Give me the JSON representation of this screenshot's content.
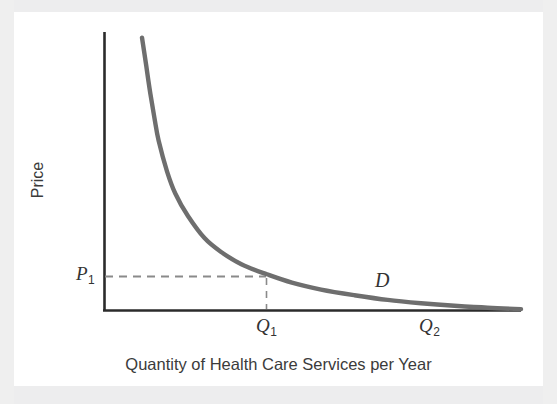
{
  "figure": {
    "background_color": "#f2f2f2",
    "plate_color": "#ffffff",
    "axis_color": "#2b2b2b",
    "curve_color": "#6e6e6e",
    "guide_color": "#8a8a8a",
    "text_color": "#3b3b3b"
  },
  "axes": {
    "y_title": "Price",
    "x_title": "Quantity of Health Care Services per Year"
  },
  "annotations": {
    "price_point": {
      "symbol": "P",
      "subscript": "1"
    },
    "quantity_1": {
      "symbol": "Q",
      "subscript": "1"
    },
    "quantity_2": {
      "symbol": "Q",
      "subscript": "2"
    },
    "demand_curve": {
      "symbol": "D"
    }
  },
  "chart_data": {
    "type": "line",
    "title": "",
    "xlabel": "Quantity of Health Care Services per Year",
    "ylabel": "Price",
    "grid": false,
    "legend_position": "inline",
    "xlim": [
      0,
      100
    ],
    "ylim": [
      0,
      100
    ],
    "axis_tick_labels": {
      "x": [
        "Q1",
        "Q2"
      ],
      "y": [
        "P1"
      ]
    },
    "series": [
      {
        "name": "D",
        "label": "D",
        "description": "Downward-sloping convex demand curve for health care services, asymptotic to both axes",
        "x": [
          9,
          10,
          11,
          12,
          13,
          15,
          17,
          20,
          24,
          28,
          33,
          39,
          45,
          52,
          60,
          68,
          76,
          84,
          92,
          100
        ],
        "y": [
          98,
          88,
          78,
          69,
          61,
          50,
          42,
          34,
          26,
          21,
          16.5,
          13,
          10,
          7.5,
          5.5,
          3.8,
          2.6,
          1.7,
          1.0,
          0.5
        ]
      }
    ],
    "reference_lines": [
      {
        "name": "price-guide",
        "orientation": "horizontal",
        "style": "dashed",
        "from": [
          0,
          23
        ],
        "to": [
          39,
          23
        ],
        "label": "P1"
      },
      {
        "name": "quantity-guide",
        "orientation": "vertical",
        "style": "dashed",
        "from": [
          39,
          0
        ],
        "to": [
          39,
          23
        ],
        "label": "Q1"
      }
    ],
    "marked_points": [
      {
        "name": "equilibrium-point-1",
        "x": 39,
        "y": 23,
        "x_label": "Q1",
        "y_label": "P1"
      },
      {
        "name": "saturation-point",
        "x": 78,
        "y": 0,
        "x_label": "Q2",
        "y_label": "0"
      }
    ]
  }
}
